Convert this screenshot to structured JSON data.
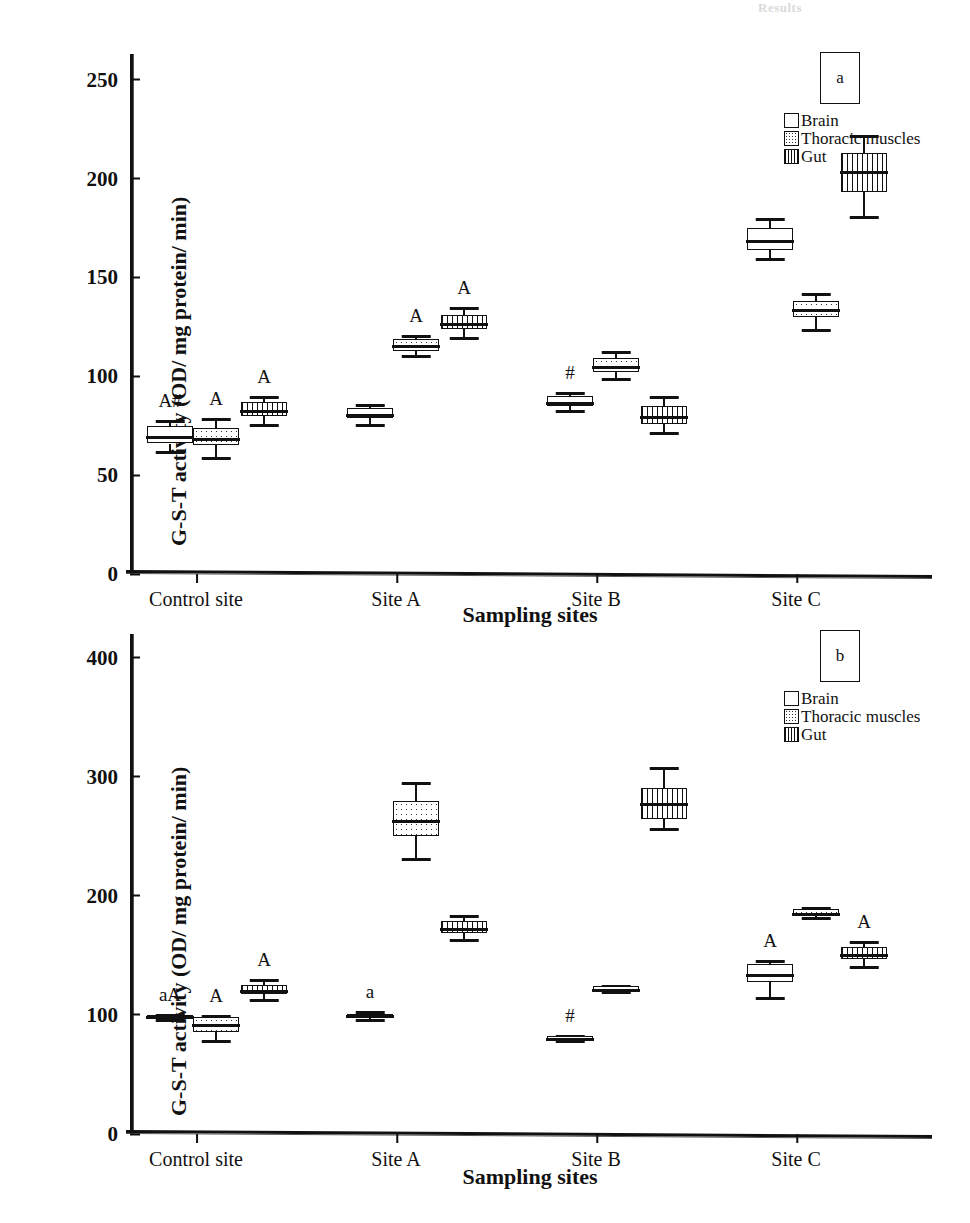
{
  "ghost_header": "Results",
  "axis": {
    "xlabel": "Sampling sites",
    "ylabel": "G-S-T activity (OD/ mg protein/ min)"
  },
  "legend": {
    "items": [
      {
        "label": "Brain",
        "pattern": "open"
      },
      {
        "label": "Thoracic muscles",
        "pattern": "dots"
      },
      {
        "label": "Gut",
        "pattern": "vlines"
      }
    ]
  },
  "panels": [
    {
      "id": "a",
      "badge": "a"
    },
    {
      "id": "b",
      "badge": "b"
    }
  ],
  "chart_data": [
    {
      "type": "box",
      "panel": "a",
      "title": "",
      "xlabel": "Sampling sites",
      "ylabel": "G-S-T activity (OD/ mg protein/ min)",
      "ylim": [
        0,
        263
      ],
      "yticks": [
        0,
        50,
        100,
        150,
        200,
        250
      ],
      "ytick_labels": [
        "0",
        "50",
        "100",
        "150",
        "200",
        "250"
      ],
      "categories": [
        "Control site",
        "Site A",
        "Site B",
        "Site C"
      ],
      "grid": false,
      "legend_position": "top-right",
      "series": [
        {
          "name": "Brain",
          "pattern": "open",
          "boxes": [
            {
              "category": "Control site",
              "min": 62,
              "q1": 66,
              "median": 70,
              "q3": 75,
              "max": 78,
              "annotation": "A#"
            },
            {
              "category": "Site A",
              "min": 76,
              "q1": 79,
              "median": 81,
              "q3": 84,
              "max": 86,
              "annotation": ""
            },
            {
              "category": "Site B",
              "min": 83,
              "q1": 85,
              "median": 87,
              "q3": 90,
              "max": 92,
              "annotation": "#"
            },
            {
              "category": "Site C",
              "min": 160,
              "q1": 164,
              "median": 169,
              "q3": 175,
              "max": 180,
              "annotation": ""
            }
          ]
        },
        {
          "name": "Thoracic muscles",
          "pattern": "dots",
          "boxes": [
            {
              "category": "Control site",
              "min": 59,
              "q1": 65,
              "median": 69,
              "q3": 74,
              "max": 79,
              "annotation": "A"
            },
            {
              "category": "Site A",
              "min": 111,
              "q1": 113,
              "median": 116,
              "q3": 119,
              "max": 121,
              "annotation": "A"
            },
            {
              "category": "Site B",
              "min": 99,
              "q1": 102,
              "median": 105,
              "q3": 109,
              "max": 113,
              "annotation": ""
            },
            {
              "category": "Site C",
              "min": 124,
              "q1": 130,
              "median": 134,
              "q3": 138,
              "max": 142,
              "annotation": ""
            }
          ]
        },
        {
          "name": "Gut",
          "pattern": "vlines",
          "boxes": [
            {
              "category": "Control site",
              "min": 76,
              "q1": 80,
              "median": 83,
              "q3": 87,
              "max": 90,
              "annotation": "A"
            },
            {
              "category": "Site A",
              "min": 120,
              "q1": 124,
              "median": 127,
              "q3": 131,
              "max": 135,
              "annotation": "A"
            },
            {
              "category": "Site B",
              "min": 72,
              "q1": 76,
              "median": 80,
              "q3": 85,
              "max": 90,
              "annotation": ""
            },
            {
              "category": "Site C",
              "min": 181,
              "q1": 193,
              "median": 204,
              "q3": 213,
              "max": 222,
              "annotation": ""
            }
          ]
        }
      ]
    },
    {
      "type": "box",
      "panel": "b",
      "title": "",
      "xlabel": "Sampling sites",
      "ylabel": "G-S-T activity (OD/ mg protein/ min)",
      "ylim": [
        0,
        420
      ],
      "yticks": [
        0,
        100,
        200,
        300,
        400
      ],
      "ytick_labels": [
        "0",
        "100",
        "200",
        "300",
        "400"
      ],
      "categories": [
        "Control site",
        "Site A",
        "Site B",
        "Site C"
      ],
      "grid": false,
      "legend_position": "top-right",
      "series": [
        {
          "name": "Brain",
          "pattern": "open",
          "boxes": [
            {
              "category": "Control site",
              "min": 97,
              "q1": 98,
              "median": 99,
              "q3": 100,
              "max": 101,
              "annotation": "aA"
            },
            {
              "category": "Site A",
              "min": 97,
              "q1": 99,
              "median": 100,
              "q3": 101,
              "max": 103,
              "annotation": "a"
            },
            {
              "category": "Site B",
              "min": 79,
              "q1": 80,
              "median": 81,
              "q3": 82,
              "max": 83,
              "annotation": "#"
            },
            {
              "category": "Site C",
              "min": 115,
              "q1": 128,
              "median": 134,
              "q3": 143,
              "max": 146,
              "annotation": "A"
            }
          ]
        },
        {
          "name": "Thoracic muscles",
          "pattern": "dots",
          "boxes": [
            {
              "category": "Control site",
              "min": 79,
              "q1": 86,
              "median": 92,
              "q3": 98,
              "max": 100,
              "annotation": "A"
            },
            {
              "category": "Site A",
              "min": 232,
              "q1": 250,
              "median": 264,
              "q3": 280,
              "max": 296,
              "annotation": ""
            },
            {
              "category": "Site B",
              "min": 120,
              "q1": 121,
              "median": 122,
              "q3": 124,
              "max": 125,
              "annotation": ""
            },
            {
              "category": "Site C",
              "min": 182,
              "q1": 184,
              "median": 186,
              "q3": 189,
              "max": 191,
              "annotation": ""
            }
          ]
        },
        {
          "name": "Gut",
          "pattern": "vlines",
          "boxes": [
            {
              "category": "Control site",
              "min": 113,
              "q1": 118,
              "median": 121,
              "q3": 125,
              "max": 130,
              "annotation": "A"
            },
            {
              "category": "Site A",
              "min": 164,
              "q1": 169,
              "median": 173,
              "q3": 179,
              "max": 184,
              "annotation": ""
            },
            {
              "category": "Site B",
              "min": 257,
              "q1": 265,
              "median": 278,
              "q3": 291,
              "max": 308,
              "annotation": ""
            },
            {
              "category": "Site C",
              "min": 141,
              "q1": 147,
              "median": 151,
              "q3": 157,
              "max": 162,
              "annotation": "A"
            }
          ]
        }
      ]
    }
  ]
}
